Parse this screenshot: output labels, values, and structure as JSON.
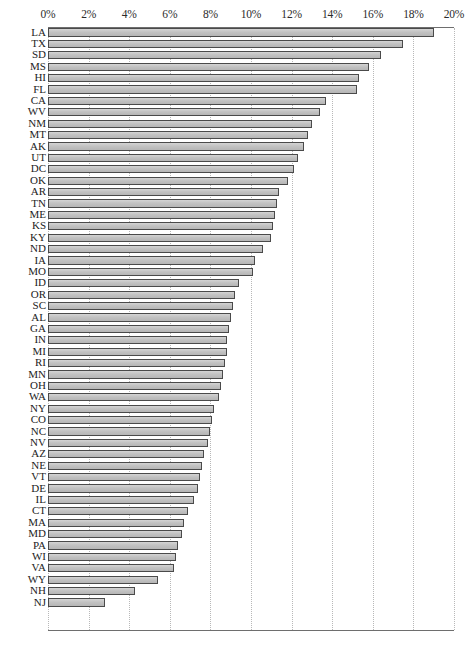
{
  "chart_data": {
    "type": "bar",
    "orientation": "horizontal",
    "title": "",
    "subtitle": "",
    "xlabel": "",
    "ylabel": "",
    "xlim": [
      0,
      20
    ],
    "xunit": "%",
    "grid": true,
    "legend": null,
    "axis": {
      "tick_values": [
        0,
        2,
        4,
        6,
        8,
        10,
        12,
        14,
        16,
        18,
        20
      ],
      "tick_labels": [
        "0%",
        "2%",
        "4%",
        "6%",
        "8%",
        "10%",
        "12%",
        "14%",
        "16%",
        "18%",
        "20%"
      ],
      "position": "top"
    },
    "style": {
      "bar_fill": "#c2c2c2",
      "bar_border": "#4a4a4a",
      "gridline_color": "#b8b8b8",
      "axis_color": "#6e6e6e",
      "background": "#ffffff"
    },
    "categories": [
      "LA",
      "TX",
      "SD",
      "MS",
      "HI",
      "FL",
      "CA",
      "WV",
      "NM",
      "MT",
      "AK",
      "UT",
      "DC",
      "OK",
      "AR",
      "TN",
      "ME",
      "KS",
      "KY",
      "ND",
      "IA",
      "MO",
      "ID",
      "OR",
      "SC",
      "AL",
      "GA",
      "IN",
      "MI",
      "RI",
      "MN",
      "OH",
      "WA",
      "NY",
      "CO",
      "NC",
      "NV",
      "AZ",
      "NE",
      "VT",
      "DE",
      "IL",
      "CT",
      "MA",
      "MD",
      "PA",
      "WI",
      "VA",
      "WY",
      "NH",
      "NJ"
    ],
    "values": [
      19.0,
      17.5,
      16.4,
      15.8,
      15.3,
      15.2,
      13.7,
      13.4,
      13.0,
      12.8,
      12.6,
      12.3,
      12.1,
      11.8,
      11.4,
      11.3,
      11.2,
      11.1,
      11.0,
      10.6,
      10.2,
      10.1,
      9.4,
      9.2,
      9.1,
      9.0,
      8.9,
      8.8,
      8.8,
      8.7,
      8.6,
      8.5,
      8.4,
      8.2,
      8.1,
      8.0,
      7.9,
      7.7,
      7.6,
      7.5,
      7.4,
      7.2,
      6.9,
      6.7,
      6.6,
      6.4,
      6.3,
      6.2,
      5.4,
      4.3,
      2.8
    ]
  }
}
